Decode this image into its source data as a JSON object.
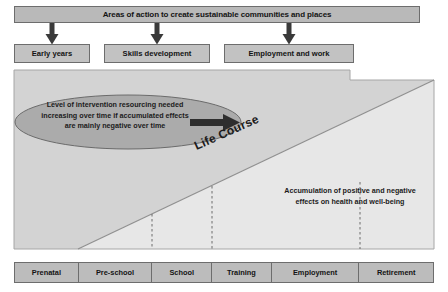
{
  "diagram": {
    "header": {
      "label": "Areas of action to create sustainable communities and places"
    },
    "arrows_down": [
      {
        "name": "arrow-down-early-years"
      },
      {
        "name": "arrow-down-skills-development"
      },
      {
        "name": "arrow-down-employment-and-work"
      }
    ],
    "action_boxes": [
      {
        "label": "Early years"
      },
      {
        "label": "Skills development"
      },
      {
        "label": "Employment and work"
      }
    ],
    "ellipse": {
      "lines": [
        "Level of intervention resourcing needed",
        "increasing over time if accumulated effects",
        "are mainly negative over time"
      ],
      "arrow_icon": "arrow-right-icon",
      "fill_color": "#aeaeae",
      "stroke_color": "#6d6d6d"
    },
    "diagonal": {
      "label": "Life Course",
      "line_color": "#9a9a9a"
    },
    "accumulation": {
      "lines": [
        "Accumulation of positive and negative",
        "effects on health and well-being"
      ]
    },
    "dashed_guides": [
      {
        "x": 152
      },
      {
        "x": 212
      },
      {
        "x": 360
      }
    ],
    "stages": [
      {
        "label": "Prenatal",
        "width": 64
      },
      {
        "label": "Pre-school",
        "width": 74
      },
      {
        "label": "School",
        "width": 60
      },
      {
        "label": "Training",
        "width": 60
      },
      {
        "label": "Employment",
        "width": 88
      },
      {
        "label": "Retirement",
        "width": 74
      }
    ],
    "colors": {
      "header_fill": "#b9b9b9",
      "box_fill": "#c2c2c2",
      "panel_upper_fill": "#d4d4d4",
      "panel_lower_fill": "#e6e6e6",
      "stage_fill": "#bcbcbc",
      "border": "#6d6d6d",
      "text": "#141414",
      "arrow": "#3a3a3a"
    }
  }
}
